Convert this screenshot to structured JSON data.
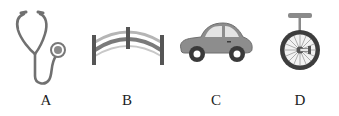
{
  "options": [
    {
      "label": "A",
      "icon": "stethoscope-icon"
    },
    {
      "label": "B",
      "icon": "arch-bridge-icon"
    },
    {
      "label": "C",
      "icon": "car-icon"
    },
    {
      "label": "D",
      "icon": "unicycle-icon"
    }
  ],
  "colors": {
    "icon_dark": "#555555",
    "icon_mid": "#8a8a8a",
    "icon_light": "#bdbdbd",
    "window_light": "#e6e6e6",
    "label": "#222222"
  }
}
